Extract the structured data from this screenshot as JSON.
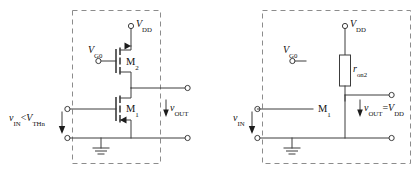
{
  "figure": {
    "type": "circuit-schematic-pair",
    "background_color": "#ffffff",
    "wire_color": "#3c3c3c",
    "dash_color": "#8c8c8c",
    "text_color": "#111111"
  },
  "left_circuit": {
    "name": "nmos-off-state",
    "caption": "",
    "supply_label_v": "V",
    "supply_label_sub": "DD",
    "gate_bias_label_v": "V",
    "gate_bias_label_sub": "G0",
    "device_top": "M",
    "device_top_sub": "2",
    "device_bottom": "M",
    "device_bottom_sub": "1",
    "input_label_v1": "v",
    "input_label_sub1": "IN",
    "input_label_rel": "<",
    "input_label_v2": "V",
    "input_label_sub2": "THn",
    "output_label_v": "v",
    "output_label_sub": "OUT",
    "ground_label": ""
  },
  "right_circuit": {
    "name": "nmos-off-equivalent",
    "caption": "",
    "supply_label_v": "V",
    "supply_label_sub": "DD",
    "gate_bias_label_v": "V",
    "gate_bias_label_sub": "G0",
    "resistor_label_r": "r",
    "resistor_label_sub": "on2",
    "device_bottom": "M",
    "device_bottom_sub": "1",
    "input_label_v": "v",
    "input_label_sub": "IN",
    "output_label_v": "v",
    "output_label_sub": "OUT",
    "output_label_eq": "=",
    "output_label_v2": "V",
    "output_label_sub2": "DD"
  }
}
